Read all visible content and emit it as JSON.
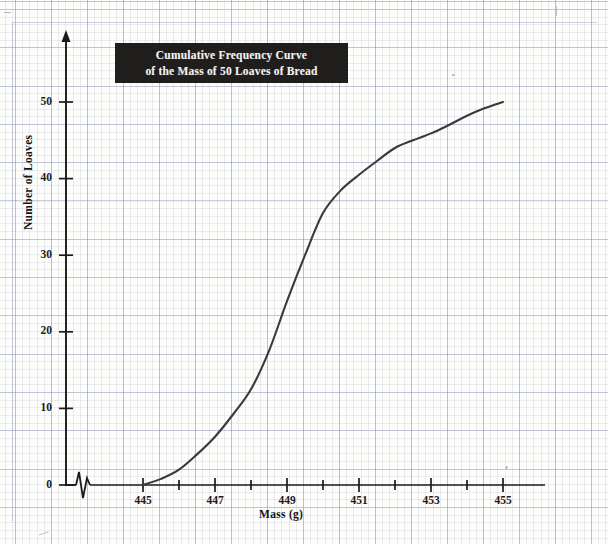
{
  "title": {
    "line1": "Cumulative Frequency Curve",
    "line2": "of the Mass of 50 Loaves of Bread"
  },
  "axes": {
    "x_title": "Mass (g)",
    "y_title": "Number of Loaves",
    "x_ticks": [
      "445",
      "447",
      "449",
      "451",
      "453",
      "455"
    ],
    "y_ticks": [
      "0",
      "10",
      "20",
      "30",
      "40",
      "50"
    ]
  },
  "colors": {
    "curve": "#3a3a3c",
    "axis": "#1a1a1a",
    "title_bg": "#201e1d",
    "title_fg": "#f4f2ee",
    "grid": "#8a94b4"
  },
  "chart_data": {
    "type": "line",
    "title": "Cumulative Frequency Curve of the Mass of 50 Loaves of Bread",
    "xlabel": "Mass (g)",
    "ylabel": "Number of Loaves",
    "xlim": [
      445,
      455
    ],
    "ylim": [
      0,
      50
    ],
    "xticks": [
      445,
      447,
      449,
      451,
      453,
      455
    ],
    "yticks": [
      0,
      10,
      20,
      30,
      40,
      50
    ],
    "x_minor_tick_step": 1,
    "grid": true,
    "legend": "none",
    "axis_break": "x-axis broken between origin and 445",
    "series": [
      {
        "name": "Cumulative frequency",
        "x": [
          445,
          445.5,
          446,
          446.5,
          447,
          447.5,
          448,
          448.5,
          449,
          449.5,
          450,
          450.5,
          451,
          451.5,
          452,
          452.5,
          453,
          453.5,
          454,
          454.5,
          455
        ],
        "y": [
          0,
          0.8,
          2.0,
          4.0,
          6.3,
          9.2,
          12.5,
          17.5,
          24.0,
          30.0,
          35.5,
          38.5,
          40.5,
          42.3,
          44.0,
          45.0,
          45.9,
          47.0,
          48.2,
          49.2,
          50.0
        ]
      }
    ]
  }
}
